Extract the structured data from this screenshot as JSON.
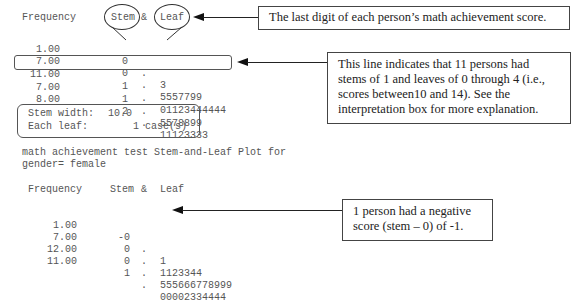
{
  "plot1": {
    "headers": {
      "frequency": "Frequency",
      "stem": "Stem",
      "amp": "&",
      "leaf": "Leaf"
    },
    "rows": [
      {
        "frequency": "1.00",
        "stem": "0",
        "dot": ".",
        "leaf": "3"
      },
      {
        "frequency": "7.00",
        "stem": "0",
        "dot": ".",
        "leaf": "5557799"
      },
      {
        "frequency": "11.00",
        "stem": "1",
        "dot": ".",
        "leaf": "01123444444"
      },
      {
        "frequency": "7.00",
        "stem": "1",
        "dot": ".",
        "leaf": "5578899"
      },
      {
        "frequency": "8.00",
        "stem": "2",
        "dot": ".",
        "leaf": "11123333"
      }
    ],
    "stem_width_label": "Stem width:",
    "stem_width_value": "10.0",
    "each_leaf_label": "Each leaf:",
    "each_leaf_value": "1 case(s)"
  },
  "plot2": {
    "title_line1": "math achievement test Stem-and-Leaf Plot for",
    "title_line2": "gender= female",
    "headers": {
      "frequency": "Frequency",
      "stem": "Stem",
      "amp": "&",
      "leaf": "Leaf"
    },
    "rows": [
      {
        "frequency": "1.00",
        "stem": "-0",
        "dot": ".",
        "leaf": "1"
      },
      {
        "frequency": "7.00",
        "stem": "0",
        "dot": ".",
        "leaf": "1123344"
      },
      {
        "frequency": "12.00",
        "stem": "0",
        "dot": ".",
        "leaf": "555666778999"
      },
      {
        "frequency": "11.00",
        "stem": "1",
        "dot": ".",
        "leaf": "00002334444"
      }
    ]
  },
  "callouts": {
    "leaf_note": "The last digit of each person’s math achievement score.",
    "line_note": "This line indicates that 11 persons had stems of 1 and leaves of 0 through 4 (i.e., scores between10 and 14). See the interpretation box for more explanation.",
    "negative_note": "1 person had a negative score (stem – 0) of -1."
  }
}
